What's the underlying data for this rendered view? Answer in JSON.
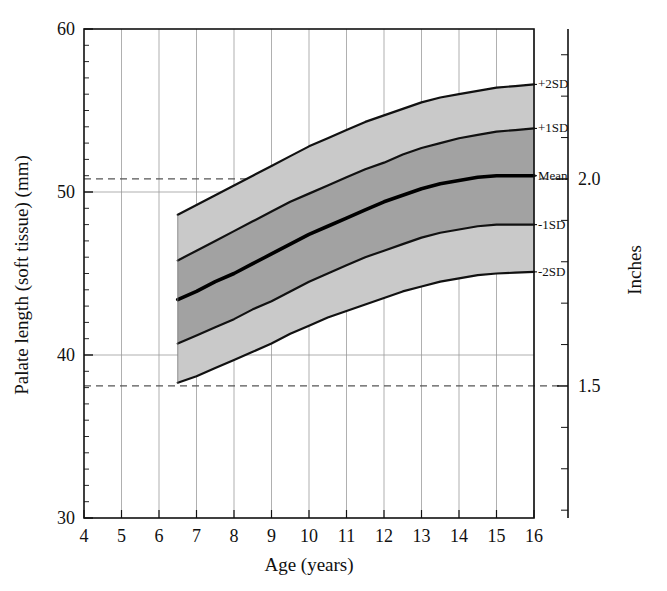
{
  "figure": {
    "background_color": "#ffffff",
    "plot_background_color": "#ffffff"
  },
  "chart_data": {
    "type": "area",
    "title": "",
    "subtitle": "",
    "xlabel": "Age (years)",
    "ylabel": "Palate length (soft tissue) (mm)",
    "y2label": "Inches",
    "xlim": [
      4,
      16
    ],
    "ylim": [
      30,
      60
    ],
    "y2lim": [
      1.181,
      2.362
    ],
    "grid": true,
    "grid_color": "#999999",
    "x_major_ticks": [
      4,
      5,
      6,
      7,
      8,
      9,
      10,
      11,
      12,
      13,
      14,
      15,
      16
    ],
    "x_tick_labels": [
      "4",
      "5",
      "6",
      "7",
      "8",
      "9",
      "10",
      "11",
      "12",
      "13",
      "14",
      "15",
      "16"
    ],
    "y_major_ticks": [
      30,
      40,
      50,
      60
    ],
    "y_tick_labels": [
      "30",
      "40",
      "50",
      "60"
    ],
    "y_minor_tick_step": 1,
    "y2_labeled_ticks": [
      {
        "value": 2.0,
        "label": "2.0",
        "mm": 50.8
      },
      {
        "value": 1.5,
        "label": "1.5",
        "mm": 38.1
      }
    ],
    "y2_minor_tick_step_inches": 0.1,
    "reference_lines": [
      {
        "name": "2.0 inches",
        "mm": 50.8,
        "style": "dashed",
        "color": "#555555"
      },
      {
        "name": "1.5 inches",
        "mm": 38.1,
        "style": "dashed",
        "color": "#555555"
      }
    ],
    "x": [
      6.5,
      7,
      7.5,
      8,
      8.5,
      9,
      9.5,
      10,
      10.5,
      11,
      11.5,
      12,
      12.5,
      13,
      13.5,
      14,
      14.5,
      15,
      15.5,
      16
    ],
    "series": [
      {
        "name": "+2SD",
        "label": "+2SD",
        "line_color": "#111111",
        "line_width": 2.2,
        "values": [
          48.6,
          49.2,
          49.8,
          50.4,
          51.0,
          51.6,
          52.2,
          52.8,
          53.3,
          53.8,
          54.3,
          54.7,
          55.1,
          55.5,
          55.8,
          56.0,
          56.2,
          56.4,
          56.5,
          56.6
        ]
      },
      {
        "name": "+1SD",
        "label": "+1SD",
        "line_color": "#111111",
        "line_width": 2.2,
        "values": [
          45.8,
          46.4,
          47.0,
          47.6,
          48.2,
          48.8,
          49.4,
          49.9,
          50.4,
          50.9,
          51.4,
          51.8,
          52.3,
          52.7,
          53.0,
          53.3,
          53.5,
          53.7,
          53.8,
          53.9
        ]
      },
      {
        "name": "Mean",
        "label": "Mean",
        "line_color": "#000000",
        "line_width": 3.6,
        "values": [
          43.4,
          43.9,
          44.5,
          45.0,
          45.6,
          46.2,
          46.8,
          47.4,
          47.9,
          48.4,
          48.9,
          49.4,
          49.8,
          50.2,
          50.5,
          50.7,
          50.9,
          51.0,
          51.0,
          51.0
        ]
      },
      {
        "name": "-1SD",
        "label": "-1SD",
        "line_color": "#111111",
        "line_width": 2.2,
        "values": [
          40.7,
          41.2,
          41.7,
          42.2,
          42.8,
          43.3,
          43.9,
          44.5,
          45.0,
          45.5,
          46.0,
          46.4,
          46.8,
          47.2,
          47.5,
          47.7,
          47.9,
          48.0,
          48.0,
          48.0
        ]
      },
      {
        "name": "-2SD",
        "label": "-2SD",
        "line_color": "#111111",
        "line_width": 2.2,
        "values": [
          38.3,
          38.7,
          39.2,
          39.7,
          40.2,
          40.7,
          41.3,
          41.8,
          42.3,
          42.7,
          43.1,
          43.5,
          43.9,
          44.2,
          44.5,
          44.7,
          44.9,
          45.0,
          45.05,
          45.1
        ]
      }
    ],
    "bands": [
      {
        "name": "outer-upper",
        "from": "+1SD",
        "to": "+2SD",
        "fill": "#c9c9c9"
      },
      {
        "name": "inner-upper",
        "from": "Mean",
        "to": "+1SD",
        "fill": "#a2a2a2"
      },
      {
        "name": "inner-lower",
        "from": "-1SD",
        "to": "Mean",
        "fill": "#a2a2a2"
      },
      {
        "name": "outer-lower",
        "from": "-2SD",
        "to": "-1SD",
        "fill": "#c9c9c9"
      }
    ],
    "annotations": [
      {
        "name": "plus-2sd-label",
        "text": "+2SD",
        "at_age": 16,
        "mm": 56.6
      },
      {
        "name": "plus-1sd-label",
        "text": "+1SD",
        "at_age": 16,
        "mm": 53.9
      },
      {
        "name": "mean-label",
        "text": "Mean",
        "at_age": 16,
        "mm": 51.0
      },
      {
        "name": "minus-1sd-label",
        "text": "-1SD",
        "at_age": 16,
        "mm": 48.0
      },
      {
        "name": "minus-2sd-label",
        "text": "-2SD",
        "at_age": 16,
        "mm": 45.1
      }
    ]
  }
}
